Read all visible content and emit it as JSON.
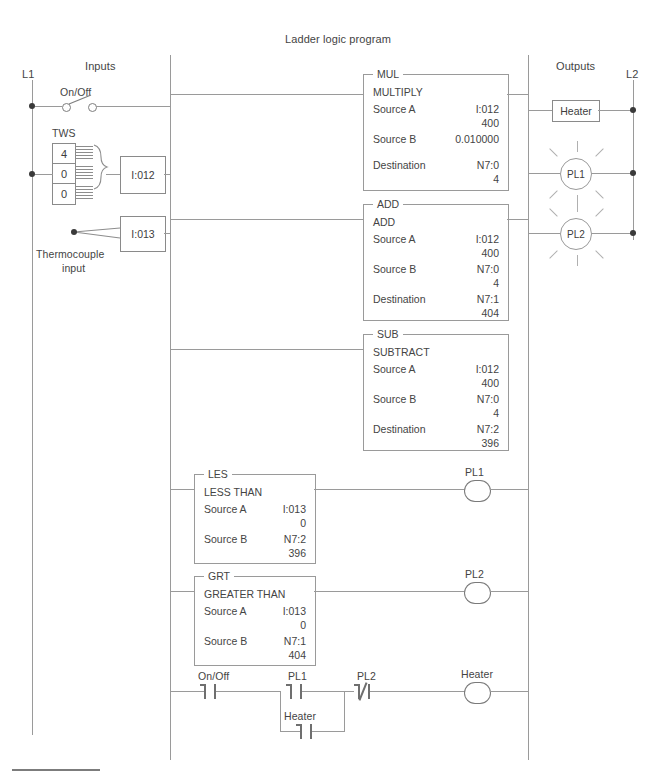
{
  "title": "Ladder logic program",
  "sections": {
    "inputs_header": "Inputs",
    "outputs_header": "Outputs",
    "rail_left": "L1",
    "rail_right": "L2"
  },
  "field_devices": {
    "switch_label": "On/Off",
    "tws_label": "TWS",
    "tws_digits": [
      "4",
      "0",
      "0"
    ],
    "input_module_1": "I:012",
    "input_module_2": "I:013",
    "thermocouple_label_line1": "Thermocouple",
    "thermocouple_label_line2": "input"
  },
  "outputs": {
    "heater_label": "Heater",
    "lamp1_label": "PL1",
    "lamp2_label": "PL2"
  },
  "blocks": [
    {
      "tag": "MUL",
      "name": "MULTIPLY",
      "rows": [
        {
          "label": "Source A",
          "operand": "I:012",
          "value": "400"
        },
        {
          "label": "Source B",
          "operand": "0.010000",
          "value": ""
        },
        {
          "label": "Destination",
          "operand": "N7:0",
          "value": "4"
        }
      ]
    },
    {
      "tag": "ADD",
      "name": "ADD",
      "rows": [
        {
          "label": "Source A",
          "operand": "I:012",
          "value": "400"
        },
        {
          "label": "Source B",
          "operand": "N7:0",
          "value": "4"
        },
        {
          "label": "Destination",
          "operand": "N7:1",
          "value": "404"
        }
      ]
    },
    {
      "tag": "SUB",
      "name": "SUBTRACT",
      "rows": [
        {
          "label": "Source A",
          "operand": "I:012",
          "value": "400"
        },
        {
          "label": "Source B",
          "operand": "N7:0",
          "value": "4"
        },
        {
          "label": "Destination",
          "operand": "N7:2",
          "value": "396"
        }
      ]
    },
    {
      "tag": "LES",
      "name": "LESS THAN",
      "rows": [
        {
          "label": "Source A",
          "operand": "I:013",
          "value": "0"
        },
        {
          "label": "Source B",
          "operand": "N7:2",
          "value": "396"
        }
      ],
      "coil_label": "PL1"
    },
    {
      "tag": "GRT",
      "name": "GREATER THAN",
      "rows": [
        {
          "label": "Source A",
          "operand": "I:013",
          "value": "0"
        },
        {
          "label": "Source B",
          "operand": "N7:1",
          "value": "404"
        }
      ],
      "coil_label": "PL2"
    }
  ],
  "bottom_rung": {
    "contact_1": "On/Off",
    "contact_2": "PL1",
    "contact_3": "PL2",
    "branch_contact": "Heater",
    "coil": "Heater"
  }
}
